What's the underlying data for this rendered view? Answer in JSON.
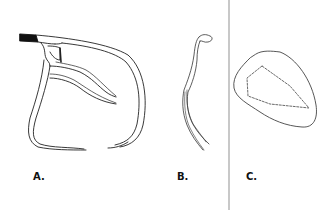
{
  "figure": {
    "panels": [
      {
        "id": "A",
        "label": "A.",
        "description": "coronary-vessel-outline"
      },
      {
        "id": "B",
        "label": "B.",
        "description": "vessel-side-profile"
      },
      {
        "id": "C",
        "label": "C.",
        "description": "cross-section-with-dashed-lumen"
      }
    ],
    "colors": {
      "stroke": "#222222",
      "divider": "#c8c8c8",
      "background": "#ffffff"
    }
  }
}
